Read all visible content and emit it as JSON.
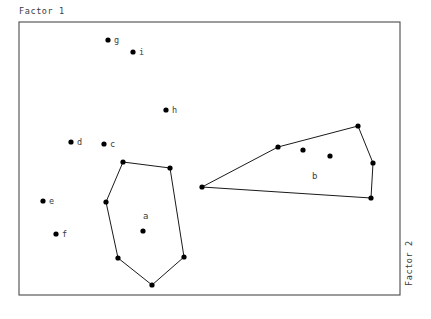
{
  "axes": {
    "title_top_left": "Factor 1",
    "title_right_vertical": "Factor 2"
  },
  "style": {
    "background": "#ffffff",
    "frame_color": "#4a4a4a",
    "point_color": "#000000",
    "hull_color": "#1a1a1a",
    "text_color": "#3b3b3b"
  },
  "frame": {
    "x": 19,
    "y": 22,
    "width": 381,
    "height": 273
  },
  "chart_data": {
    "type": "scatter",
    "title": "",
    "xlabel": "Factor 2",
    "ylabel": "Factor 1",
    "grid": false,
    "legend": "none",
    "xlim": [
      19,
      400
    ],
    "ylim": [
      22,
      295
    ],
    "labeled_points": [
      {
        "label": "g",
        "x": 108,
        "y": 40,
        "label_dx": 6,
        "label_dy": 3
      },
      {
        "label": "i",
        "x": 133,
        "y": 52,
        "label_dx": 6,
        "label_dy": 3
      },
      {
        "label": "h",
        "x": 166,
        "y": 110,
        "label_dx": 6,
        "label_dy": 3
      },
      {
        "label": "d",
        "x": 71,
        "y": 142,
        "label_dx": 6,
        "label_dy": 3
      },
      {
        "label": "c",
        "x": 104,
        "y": 144,
        "label_dx": 6,
        "label_dy": 3
      },
      {
        "label": "e",
        "x": 43,
        "y": 201,
        "label_dx": 6,
        "label_dy": 3
      },
      {
        "label": "f",
        "x": 56,
        "y": 234,
        "label_dx": 6,
        "label_dy": 3
      }
    ],
    "clusters": [
      {
        "name": "a",
        "label_x": 143,
        "label_y": 219,
        "hull": [
          [
            123,
            162
          ],
          [
            170,
            168
          ],
          [
            184,
            257
          ],
          [
            152,
            285
          ],
          [
            118,
            258
          ],
          [
            106,
            202
          ]
        ],
        "interior_points": [
          [
            143,
            231
          ]
        ]
      },
      {
        "name": "b",
        "label_x": 312,
        "label_y": 179,
        "hull": [
          [
            202,
            187
          ],
          [
            278,
            147
          ],
          [
            358,
            126
          ],
          [
            373,
            163
          ],
          [
            371,
            198
          ]
        ],
        "interior_points": [
          [
            303,
            150
          ],
          [
            330,
            156
          ]
        ]
      }
    ],
    "point_radius": 2.6
  }
}
